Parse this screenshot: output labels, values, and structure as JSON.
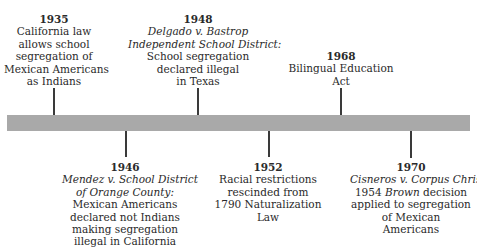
{
  "timeline": {
    "bar_color": "#a9a9a9",
    "events_above": [
      {
        "year": "1935",
        "case_lines": [],
        "lines": [
          "California law",
          "allows school",
          "segregation of",
          "Mexican Americans",
          "as Indians"
        ]
      },
      {
        "year": "1948",
        "case_lines": [
          "Delgado v. Bastrop",
          "Independent School District:"
        ],
        "lines": [
          "School segregation",
          "declared illegal",
          "in Texas"
        ]
      },
      {
        "year": "1968",
        "case_lines": [],
        "lines": [
          "Bilingual Education",
          "Act"
        ]
      }
    ],
    "events_below": [
      {
        "year": "1946",
        "case_lines": [
          "Mendez v. School District",
          "of Orange County:"
        ],
        "lines": [
          "Mexican Americans",
          "declared not Indians",
          "making segregation",
          "illegal in California"
        ]
      },
      {
        "year": "1952",
        "case_lines": [],
        "lines": [
          "Racial restrictions",
          "rescinded from",
          "1790 Naturalization",
          "Law"
        ]
      },
      {
        "year": "1970",
        "case_lines": [
          "Cisneros v. Corpus Christi:"
        ],
        "line1_prefix": "1954 ",
        "line1_italic": "Brown",
        "line1_suffix": " decision",
        "lines": [
          "applied to segregation",
          "of Mexican",
          "Americans"
        ]
      }
    ]
  }
}
